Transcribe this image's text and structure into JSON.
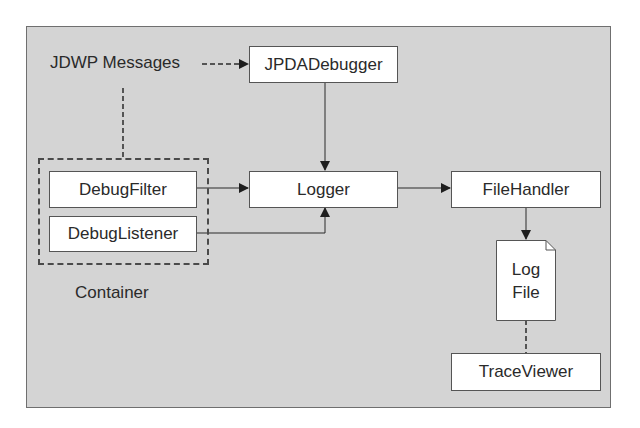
{
  "diagram": {
    "labels": {
      "jdwp_messages": "JDWP Messages",
      "container": "Container"
    },
    "nodes": {
      "jpda_debugger": "JPDADebugger",
      "debug_filter": "DebugFilter",
      "debug_listener": "DebugListener",
      "logger": "Logger",
      "file_handler": "FileHandler",
      "log_file_line1": "Log",
      "log_file_line2": "File",
      "trace_viewer": "TraceViewer"
    },
    "edges": [
      {
        "from": "JDWP Messages",
        "to": "JPDADebugger",
        "style": "dashed",
        "arrow": true
      },
      {
        "from": "JDWP Messages",
        "to": "Container",
        "style": "dashed",
        "arrow": false
      },
      {
        "from": "JPDADebugger",
        "to": "Logger",
        "style": "solid",
        "arrow": true
      },
      {
        "from": "DebugFilter",
        "to": "Logger",
        "style": "solid",
        "arrow": true
      },
      {
        "from": "DebugListener",
        "to": "Logger",
        "style": "solid",
        "arrow": true
      },
      {
        "from": "Logger",
        "to": "FileHandler",
        "style": "solid",
        "arrow": true
      },
      {
        "from": "FileHandler",
        "to": "Log File",
        "style": "solid",
        "arrow": true
      },
      {
        "from": "Log File",
        "to": "TraceViewer",
        "style": "dashed",
        "arrow": false
      }
    ],
    "colors": {
      "panel_bg": "#d4d4d4",
      "box_bg": "#ffffff",
      "line": "#2a2a2a"
    }
  }
}
